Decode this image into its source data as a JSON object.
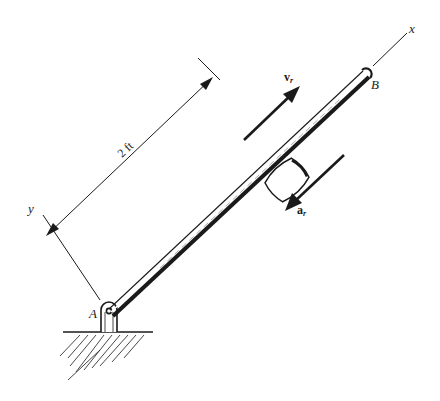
{
  "figure": {
    "labels": {
      "point_a": "A",
      "point_b": "B",
      "x_axis": "x",
      "y_axis": "y",
      "dimension": "2 ft",
      "velocity_main": "v",
      "velocity_sub": "r",
      "acceleration_main": "a",
      "acceleration_sub": "r"
    },
    "colors": {
      "ink": "#1a1a1a",
      "background": "#ffffff"
    }
  }
}
